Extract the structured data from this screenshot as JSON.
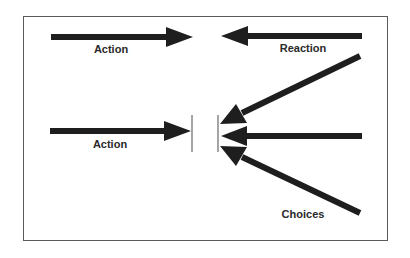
{
  "diagram": {
    "labels": {
      "action_top": "Action",
      "reaction": "Reaction",
      "action_bottom": "Action",
      "choices": "Choices"
    },
    "colors": {
      "arrow": "#1e1e1e",
      "frame": "#5a5a5a",
      "barrier": "#4a4a4a",
      "background": "#ffffff"
    },
    "arrows": [
      {
        "id": "action-top",
        "from": [
          51,
          37
        ],
        "to": [
          193,
          37
        ],
        "direction": "right"
      },
      {
        "id": "reaction",
        "from": [
          362,
          36
        ],
        "to": [
          221,
          36
        ],
        "direction": "left"
      },
      {
        "id": "action-bottom",
        "from": [
          50,
          131
        ],
        "to": [
          191,
          131
        ],
        "direction": "right"
      },
      {
        "id": "choice-upper",
        "from": [
          360,
          56
        ],
        "to": [
          220,
          124
        ],
        "direction": "down-left"
      },
      {
        "id": "choice-middle",
        "from": [
          362,
          136
        ],
        "to": [
          221,
          136
        ],
        "direction": "left"
      },
      {
        "id": "choice-lower",
        "from": [
          360,
          213
        ],
        "to": [
          220,
          146
        ],
        "direction": "up-left"
      }
    ],
    "barriers": [
      {
        "id": "left-barrier",
        "x": 192,
        "y1": 115,
        "y2": 152
      },
      {
        "id": "right-barrier",
        "x": 218,
        "y1": 115,
        "y2": 152
      }
    ]
  }
}
